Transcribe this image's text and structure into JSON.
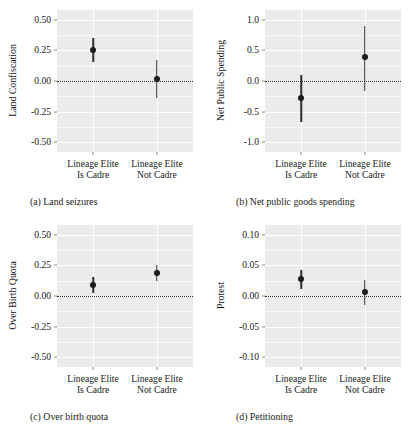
{
  "figure": {
    "width": 415,
    "height": 430,
    "background": "#ffffff",
    "panel_background": "#ebebeb",
    "gridline_color": "#ffffff",
    "point_color": "#1c1c1c",
    "errorbar_color": "#2f2f2f",
    "zero_reference_line": "dotted black at y = 0"
  },
  "shared": {
    "x_categories": [
      {
        "line1": "Lineage Elite",
        "line2": "Is Cadre"
      },
      {
        "line1": "Lineage Elite",
        "line2": "Not Cadre"
      }
    ]
  },
  "chart_data": [
    {
      "type": "scatter",
      "panel": "a",
      "title": "(a) Land seizures",
      "xlabel": "",
      "ylabel": "Land Confiscation",
      "ylim": [
        -0.58,
        0.58
      ],
      "yticks": [
        0.5,
        0.25,
        0.0,
        -0.25,
        -0.5
      ],
      "ytick_labels": [
        "0.50",
        "0.25",
        "0.00",
        "-0.25",
        "-0.50"
      ],
      "grid": true,
      "legend": "none",
      "categories": [
        "Lineage Elite Is Cadre",
        "Lineage Elite Not Cadre"
      ],
      "values": [
        0.255,
        0.015
      ],
      "ci_low": [
        0.152,
        -0.142
      ],
      "ci_high": [
        0.352,
        0.172
      ]
    },
    {
      "type": "scatter",
      "panel": "b",
      "title": "(b) Net public goods spending",
      "xlabel": "",
      "ylabel": "Net Public Spending",
      "ylim": [
        -1.16,
        1.16
      ],
      "yticks": [
        1.0,
        0.5,
        0.0,
        -0.5,
        -1.0
      ],
      "ytick_labels": [
        "1.0",
        "0.5",
        "0.0",
        "-0.5",
        "-1.0"
      ],
      "grid": true,
      "legend": "none",
      "categories": [
        "Lineage Elite Is Cadre",
        "Lineage Elite Not Cadre"
      ],
      "values": [
        -0.28,
        0.39
      ],
      "ci_low": [
        -0.67,
        -0.17
      ],
      "ci_high": [
        0.1,
        0.9
      ]
    },
    {
      "type": "scatter",
      "panel": "c",
      "title": "(c) Over birth quota",
      "xlabel": "",
      "ylabel": "Over Birth Quota",
      "ylim": [
        -0.58,
        0.58
      ],
      "yticks": [
        0.5,
        0.25,
        0.0,
        -0.25,
        -0.5
      ],
      "ytick_labels": [
        "0.50",
        "0.25",
        "0.00",
        "-0.25",
        "-0.50"
      ],
      "grid": true,
      "legend": "none",
      "categories": [
        "Lineage Elite Is Cadre",
        "Lineage Elite Not Cadre"
      ],
      "values": [
        0.088,
        0.185
      ],
      "ci_low": [
        0.022,
        0.122
      ],
      "ci_high": [
        0.155,
        0.25
      ]
    },
    {
      "type": "scatter",
      "panel": "d",
      "title": "(d) Petitioning",
      "xlabel": "",
      "ylabel": "Protest",
      "ylim": [
        -0.116,
        0.116
      ],
      "yticks": [
        0.1,
        0.05,
        0.0,
        -0.05,
        -0.1
      ],
      "ytick_labels": [
        "0.10",
        "0.05",
        "0.00",
        "-0.05",
        "-0.10"
      ],
      "grid": true,
      "legend": "none",
      "categories": [
        "Lineage Elite Is Cadre",
        "Lineage Elite Not Cadre"
      ],
      "values": [
        0.028,
        0.006
      ],
      "ci_low": [
        0.012,
        -0.014
      ],
      "ci_high": [
        0.043,
        0.026
      ]
    }
  ]
}
